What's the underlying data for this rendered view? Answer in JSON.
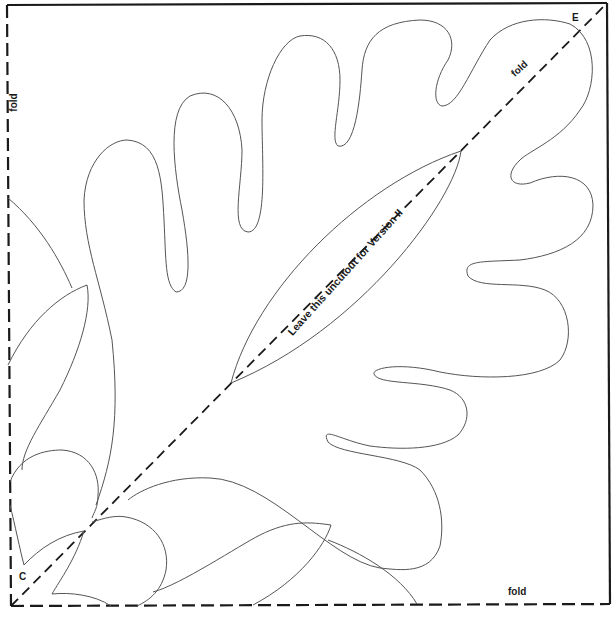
{
  "pattern": {
    "type": "quilt-appliqué template quarter-square",
    "labels": {
      "fold_left": "fold",
      "fold_diagonal": "fold",
      "fold_bottom": "fold",
      "corner_top_right": "E",
      "corner_bottom_left": "C",
      "note": "Leave this uncutout for Version II"
    },
    "colors": {
      "outline": "#555555",
      "fold_line": "#1a1a1a",
      "background": "#ffffff"
    }
  }
}
